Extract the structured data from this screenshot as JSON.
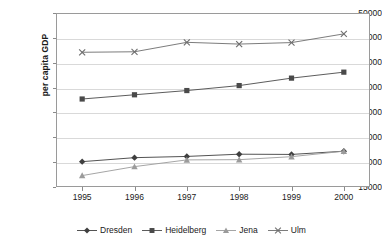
{
  "chart_data": {
    "type": "line",
    "title": "",
    "xlabel": "",
    "ylabel": "per capita GDP",
    "categories": [
      "1995",
      "1996",
      "1997",
      "1998",
      "1999",
      "2000"
    ],
    "x": [
      1995,
      1996,
      1997,
      1998,
      1999,
      2000
    ],
    "ylim": [
      15000,
      50000
    ],
    "ytick_labels": [
      "15000",
      "20000",
      "25000",
      "30000",
      "35000",
      "40000",
      "45000",
      "50000"
    ],
    "yticks": [
      15000,
      20000,
      25000,
      30000,
      35000,
      40000,
      45000,
      50000
    ],
    "grid": true,
    "legend_position": "bottom",
    "series": [
      {
        "name": "Dresden",
        "marker": "diamond",
        "color": "#3f3f3f",
        "values": [
          20100,
          20900,
          21150,
          21600,
          21550,
          22200
        ]
      },
      {
        "name": "Heidelberg",
        "marker": "square",
        "color": "#4a4a4a",
        "values": [
          32700,
          33550,
          34400,
          35400,
          36900,
          38100
        ]
      },
      {
        "name": "Jena",
        "marker": "triangle",
        "color": "#9b9b9b",
        "values": [
          17300,
          19100,
          20450,
          20500,
          21100,
          22200
        ]
      },
      {
        "name": "Ulm",
        "marker": "cross",
        "color": "#6d6d6d",
        "values": [
          42100,
          42200,
          44100,
          43750,
          44050,
          45800
        ]
      }
    ]
  },
  "axes": {
    "y_title": "per capita GDP"
  }
}
